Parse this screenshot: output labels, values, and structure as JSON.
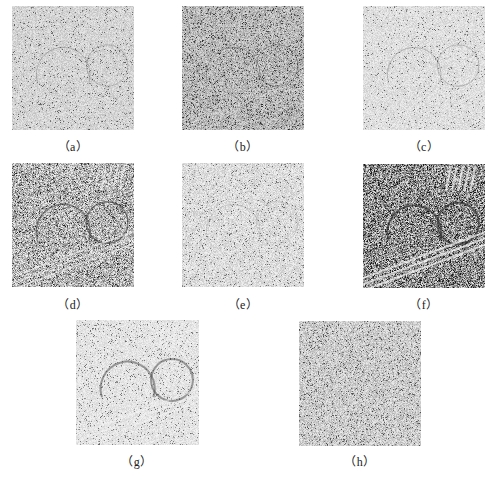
{
  "figure": {
    "panels": [
      {
        "id": "a",
        "caption": "（a）",
        "tone": "light-uniform-noise"
      },
      {
        "id": "b",
        "caption": "（b）",
        "tone": "medium-gray-noise"
      },
      {
        "id": "c",
        "caption": "（c）",
        "tone": "light-sparse-noise"
      },
      {
        "id": "d",
        "caption": "（d）",
        "tone": "high-contrast-structured"
      },
      {
        "id": "e",
        "caption": "（e）",
        "tone": "light-speckle"
      },
      {
        "id": "f",
        "caption": "（f）",
        "tone": "dark-high-contrast-structured"
      },
      {
        "id": "g",
        "caption": "（g）",
        "tone": "light-smooth-structured"
      },
      {
        "id": "h",
        "caption": "（h）",
        "tone": "light-dense-noise"
      }
    ]
  }
}
